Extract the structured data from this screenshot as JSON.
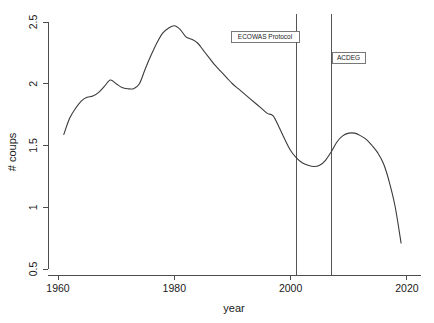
{
  "chart_data": {
    "type": "line",
    "title": "",
    "xlabel": "year",
    "ylabel": "# coups",
    "xlim": [
      1960,
      2020
    ],
    "ylim": [
      0.5,
      2.5
    ],
    "xticks": [
      1960,
      1980,
      2000,
      2020
    ],
    "xtick_labels": [
      "1960",
      "1980",
      "2000",
      "2020"
    ],
    "yticks": [
      0.5,
      1,
      1.5,
      2,
      2.5
    ],
    "ytick_labels": [
      "0.5",
      "1",
      "1.5",
      "2",
      "2.5"
    ],
    "grid": false,
    "legend": "none",
    "line_color": "#3a3a3a",
    "series": [
      {
        "name": "# coups",
        "x": [
          1961,
          1962,
          1963,
          1964,
          1965,
          1966,
          1967,
          1968,
          1969,
          1970,
          1971,
          1972,
          1973,
          1974,
          1975,
          1976,
          1977,
          1978,
          1979,
          1980,
          1981,
          1982,
          1983,
          1984,
          1985,
          1986,
          1987,
          1988,
          1989,
          1990,
          1991,
          1992,
          1993,
          1994,
          1995,
          1996,
          1997,
          1998,
          1999,
          2000,
          2001,
          2002,
          2003,
          2004,
          2005,
          2006,
          2007,
          2008,
          2009,
          2010,
          2011,
          2012,
          2013,
          2014,
          2015,
          2016,
          2017,
          2018,
          2019
        ],
        "y": [
          1.59,
          1.72,
          1.8,
          1.86,
          1.89,
          1.9,
          1.93,
          1.98,
          2.03,
          2.0,
          1.97,
          1.96,
          1.96,
          2.0,
          2.12,
          2.23,
          2.33,
          2.41,
          2.45,
          2.47,
          2.44,
          2.38,
          2.36,
          2.33,
          2.27,
          2.21,
          2.15,
          2.1,
          2.05,
          2.0,
          1.96,
          1.92,
          1.88,
          1.84,
          1.8,
          1.76,
          1.74,
          1.65,
          1.55,
          1.46,
          1.4,
          1.36,
          1.34,
          1.33,
          1.34,
          1.38,
          1.45,
          1.53,
          1.58,
          1.6,
          1.6,
          1.58,
          1.55,
          1.5,
          1.44,
          1.35,
          1.2,
          1.0,
          0.71
        ]
      }
    ],
    "annotations": [
      {
        "label": "ECOWAS Protocol",
        "x": 2001,
        "kind": "vertical-line-with-label"
      },
      {
        "label": "ACDEG",
        "x": 2007,
        "kind": "vertical-line-with-label"
      }
    ]
  }
}
